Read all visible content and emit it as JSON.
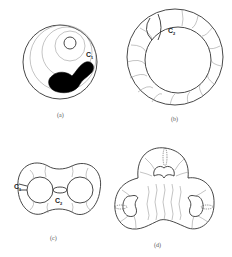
{
  "figure": {
    "panels": [
      {
        "id": "a",
        "caption": "(a)",
        "label": "C",
        "label_sub": "1",
        "description": "Disk with nested circles and a black blob"
      },
      {
        "id": "b",
        "caption": "(b)",
        "label": "C",
        "label_sub": "2",
        "description": "Annulus with transverse arcs"
      },
      {
        "id": "c",
        "caption": "(c)",
        "labels": [
          {
            "text": "C",
            "sub": "1"
          },
          {
            "text": "C",
            "sub": "2"
          }
        ],
        "description": "Disk with two holes"
      },
      {
        "id": "d",
        "caption": "(d)",
        "description": "Disk with three kidney-shaped holes"
      }
    ],
    "colors": {
      "stroke": "#333333",
      "fill_blob": "#000000",
      "background": "#ffffff"
    }
  }
}
